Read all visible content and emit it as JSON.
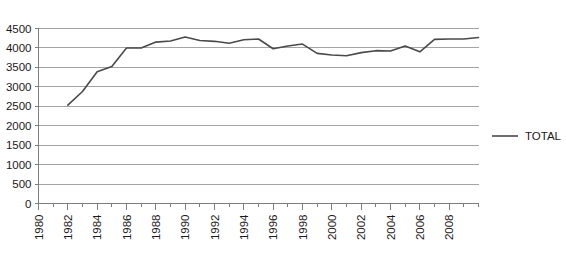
{
  "chart_data": {
    "type": "line",
    "title": "",
    "subtitle": "",
    "xlabel": "",
    "ylabel": "",
    "grid": true,
    "legend_position": "right",
    "xlim": [
      1980,
      2010
    ],
    "ylim": [
      0,
      4500
    ],
    "y_ticks": [
      0,
      500,
      1000,
      1500,
      2000,
      2500,
      3000,
      3500,
      4000,
      4500
    ],
    "y_tick_labels": [
      "0",
      "500",
      "1000",
      "1500",
      "2000",
      "2500",
      "3000",
      "3500",
      "4000",
      "4500"
    ],
    "x_ticks": [
      1980,
      1981,
      1982,
      1983,
      1984,
      1985,
      1986,
      1987,
      1988,
      1989,
      1990,
      1991,
      1992,
      1993,
      1994,
      1995,
      1996,
      1997,
      1998,
      1999,
      2000,
      2001,
      2002,
      2003,
      2004,
      2005,
      2006,
      2007,
      2008,
      2009,
      2010
    ],
    "x_tick_labels": [
      "1980",
      "1982",
      "1984",
      "1986",
      "1988",
      "1990",
      "1992",
      "1994",
      "1996",
      "1998",
      "2000",
      "2002",
      "2004",
      "2006",
      "2008"
    ],
    "x_labeled_ticks": [
      1980,
      1982,
      1984,
      1986,
      1988,
      1990,
      1992,
      1994,
      1996,
      1998,
      2000,
      2002,
      2004,
      2006,
      2008
    ],
    "x_label_rotation": -90,
    "series": [
      {
        "name": "TOTAL",
        "color": "#4a4a4a",
        "x": [
          1982,
          1983,
          1984,
          1985,
          1986,
          1987,
          1988,
          1989,
          1990,
          1991,
          1992,
          1993,
          1994,
          1995,
          1996,
          1997,
          1998,
          1999,
          2000,
          2001,
          2002,
          2003,
          2004,
          2005,
          2006,
          2007,
          2008,
          2009,
          2010
        ],
        "values": [
          2530,
          2880,
          3390,
          3520,
          4000,
          4000,
          4150,
          4180,
          4280,
          4190,
          4170,
          4120,
          4210,
          4230,
          3980,
          4050,
          4100,
          3860,
          3820,
          3800,
          3880,
          3930,
          3920,
          4050,
          3900,
          4220,
          4230,
          4230,
          4270
        ]
      }
    ],
    "legend": [
      {
        "label": "TOTAL",
        "color": "#4a4a4a",
        "marker": "line"
      }
    ]
  },
  "colors": {
    "series_line": "#4a4a4a",
    "gridline": "#9a9a9a",
    "axis": "#7d7d7d",
    "background": "#ffffff",
    "text": "#1a1a1a"
  }
}
